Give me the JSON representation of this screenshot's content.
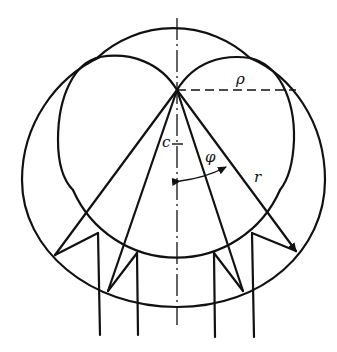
{
  "figure": {
    "labels": {
      "rho": "ρ",
      "c": "c",
      "phi": "φ",
      "r": "r"
    },
    "colors": {
      "line": "#111111",
      "background": "#ffffff"
    }
  }
}
